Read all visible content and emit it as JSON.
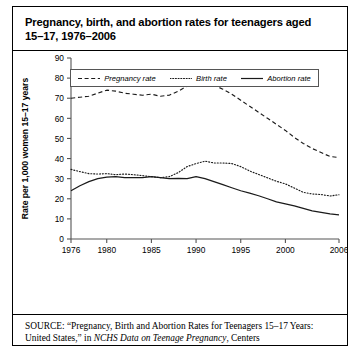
{
  "figure": {
    "title": "Pregnancy, birth, and abortion rates for teenagers aged\n15–17, 1976–2006",
    "source_label": "SOURCE:",
    "source_quote": "“Pregnancy, Birth and Abortion Rates for Teenagers 15–17 Years: United States,” in ",
    "source_italic": "NCHS Data on Teenage Pregnancy",
    "source_tail": ", Centers"
  },
  "colors": {
    "line": "#1a1a1a",
    "axis": "#555555",
    "border": "#000000",
    "background": "#ffffff"
  },
  "chart_data": {
    "type": "line",
    "title": "Pregnancy, birth, and abortion rates for teenagers aged 15–17, 1976–2006",
    "xlabel": "",
    "ylabel": "Rate per 1,000 women 15–17 years",
    "xlim": [
      1976,
      2006
    ],
    "ylim": [
      0,
      90
    ],
    "yticks": [
      0,
      10,
      20,
      30,
      40,
      50,
      60,
      70,
      80,
      90
    ],
    "xticks": [
      1976,
      1980,
      1985,
      1990,
      1995,
      2000,
      2006
    ],
    "grid": false,
    "legend_position": "top-center",
    "x": [
      1976,
      1977,
      1978,
      1979,
      1980,
      1981,
      1982,
      1983,
      1984,
      1985,
      1986,
      1987,
      1988,
      1989,
      1990,
      1991,
      1992,
      1993,
      1994,
      1995,
      1996,
      1997,
      1998,
      1999,
      2000,
      2001,
      2002,
      2003,
      2004,
      2005,
      2006
    ],
    "series": [
      {
        "name": "Pregnancy rate",
        "style": "dashed",
        "values": [
          70.0,
          70.5,
          71.0,
          72.5,
          74.0,
          73.5,
          72.5,
          72.0,
          71.5,
          72.0,
          71.0,
          71.5,
          73.5,
          76.0,
          77.5,
          78.0,
          76.5,
          74.5,
          72.0,
          69.0,
          66.0,
          63.0,
          60.0,
          57.0,
          54.0,
          50.5,
          47.5,
          45.0,
          43.0,
          41.0,
          40.5
        ]
      },
      {
        "name": "Birth rate",
        "style": "dotted",
        "values": [
          34.6,
          33.5,
          32.5,
          32.3,
          32.5,
          32.0,
          32.3,
          32.0,
          31.5,
          31.0,
          30.5,
          31.0,
          33.0,
          36.0,
          37.5,
          38.7,
          37.8,
          37.8,
          37.5,
          36.0,
          33.8,
          32.1,
          30.4,
          28.7,
          27.4,
          25.3,
          23.2,
          22.4,
          22.1,
          21.4,
          22.0
        ]
      },
      {
        "name": "Abortion rate",
        "style": "solid",
        "values": [
          24.0,
          26.5,
          28.5,
          30.0,
          30.8,
          31.0,
          30.5,
          30.5,
          30.5,
          31.0,
          30.5,
          30.0,
          30.2,
          30.0,
          31.0,
          30.0,
          28.5,
          27.0,
          25.5,
          24.0,
          22.8,
          21.5,
          20.0,
          18.5,
          17.5,
          16.5,
          15.2,
          14.0,
          13.2,
          12.5,
          12.0
        ]
      }
    ]
  }
}
